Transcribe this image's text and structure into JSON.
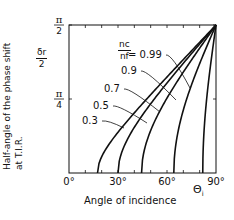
{
  "chart_data": {
    "type": "line",
    "title": "",
    "xlabel": "Angle of incidence",
    "xsymbol": "Θ",
    "xsymbol_sub": "i",
    "ylabel_line1": "Half-angle of the phase shift",
    "ylabel_line2": "at T.I.R.",
    "ysymbol_num": "δr",
    "ysymbol_den": "2",
    "xlim": [
      0,
      90
    ],
    "ylim": [
      0,
      1.5708
    ],
    "x_ticks": [
      {
        "value": 0,
        "label": "0°"
      },
      {
        "value": 30,
        "label": "30°"
      },
      {
        "value": 60,
        "label": "60°"
      },
      {
        "value": 90,
        "label": "90°"
      }
    ],
    "y_ticks": [
      {
        "value": 0.7854,
        "num": "π",
        "den": "4"
      },
      {
        "value": 1.5708,
        "num": "π",
        "den": "2"
      }
    ],
    "legend_param_num": "nc",
    "legend_param_den": "nf",
    "series": [
      {
        "name": "0.99",
        "label": "= 0.99",
        "n": 0.99,
        "critical_angle_deg": 81.9
      },
      {
        "name": "0.9",
        "label": "0.9",
        "n": 0.9,
        "critical_angle_deg": 64.2
      },
      {
        "name": "0.7",
        "label": "0.7",
        "n": 0.7,
        "critical_angle_deg": 44.4
      },
      {
        "name": "0.5",
        "label": "0.5",
        "n": 0.5,
        "critical_angle_deg": 30.0
      },
      {
        "name": "0.3",
        "label": "0.3",
        "n": 0.3,
        "critical_angle_deg": 17.5
      }
    ],
    "grid": false,
    "line_color": "#111111"
  }
}
